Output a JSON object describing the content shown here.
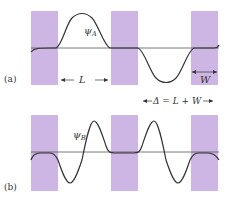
{
  "colors": {
    "barrier": "#cdb6e3",
    "curve": "#333333",
    "axis": "#555555",
    "text": "#333333"
  },
  "panel_a": {
    "label": "(a)",
    "psi_label_main": "ψ",
    "psi_label_sub": "A",
    "L_label": "L",
    "W_label": "W"
  },
  "panel_b": {
    "label": "(b)",
    "psi_label_main": "ψ",
    "psi_label_sub": "B"
  },
  "period_label": "Δ = L + W"
}
